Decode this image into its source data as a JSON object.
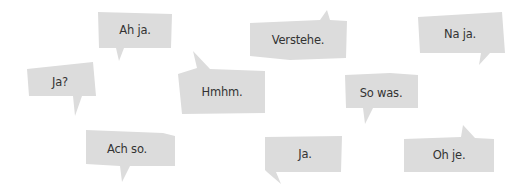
{
  "colors": {
    "background": "#ffffff",
    "bubble_fill": "#dcdcdc",
    "text": "#333333"
  },
  "bubbles": [
    {
      "id": "ah-ja",
      "text": "Ah ja.",
      "points": "98,12 172,14 171,48 124,48 119,61 116,48 99,48",
      "label_x": 135,
      "label_y": 30
    },
    {
      "id": "ja-question",
      "text": "Ja?",
      "points": "27,69 93,62 96,96 82,96 75,116 73,96 29,96",
      "label_x": 60,
      "label_y": 82
    },
    {
      "id": "hmhm",
      "text": "Hmhm.",
      "points": "178,74 197,68 193,51 210,69 265,71 265,113 182,114",
      "label_x": 222,
      "label_y": 92
    },
    {
      "id": "verstehe",
      "text": "Verstehe.",
      "points": "250,23 320,20 327,10 330,20 347,21 346,58 290,60 250,56",
      "label_x": 298,
      "label_y": 40
    },
    {
      "id": "na-ja",
      "text": "Na ja.",
      "points": "418,17 502,12 505,53 490,53 479,65 481,53 420,53",
      "label_x": 460,
      "label_y": 34
    },
    {
      "id": "so-was",
      "text": "So was.",
      "points": "345,75 390,73 418,75 418,108 373,108 365,124 363,108 346,108",
      "label_x": 381,
      "label_y": 93
    },
    {
      "id": "ach-so",
      "text": "Ach so.",
      "points": "86,130 163,133 175,136 175,166 130,166 122,182 120,166 86,164",
      "label_x": 127,
      "label_y": 149
    },
    {
      "id": "ja-period",
      "text": "Ja.",
      "points": "265,137 342,136 341,172 276,172 281,184 267,172 265,170",
      "label_x": 305,
      "label_y": 154
    },
    {
      "id": "oh-je",
      "text": "Oh je.",
      "points": "404,139 461,137 463,125 475,138 494,139 494,172 404,172",
      "label_x": 449,
      "label_y": 155
    }
  ]
}
